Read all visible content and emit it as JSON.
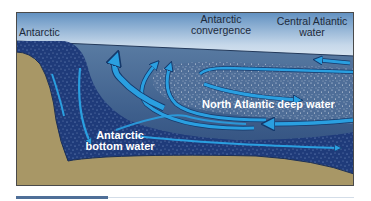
{
  "diagram": {
    "type": "ocean-circulation-cross-section",
    "labels": {
      "antarctic": "Antarctic",
      "antarctic_convergence_line1": "Antarctic",
      "antarctic_convergence_line2": "convergence",
      "central_atlantic_line1": "Central Atlantic",
      "central_atlantic_line2": "water",
      "north_atlantic_deep": "North Atlantic deep water",
      "antarctic_bottom_line1": "Antarctic",
      "antarctic_bottom_line2": "bottom water"
    },
    "colors": {
      "sky_top": "#5f8fc0",
      "sky_bottom": "#eef3f8",
      "ocean_surface": "#50729a",
      "ocean_deep": "#2c4a78",
      "bottom_water": "#1f3b7a",
      "seafloor": "#a89766",
      "arrow": "#2a9fe0",
      "arrow_outline": "#15396b",
      "frame_border": "#4a4a4a"
    }
  },
  "footer_bar": {
    "accent_color": "#4f6f98"
  }
}
